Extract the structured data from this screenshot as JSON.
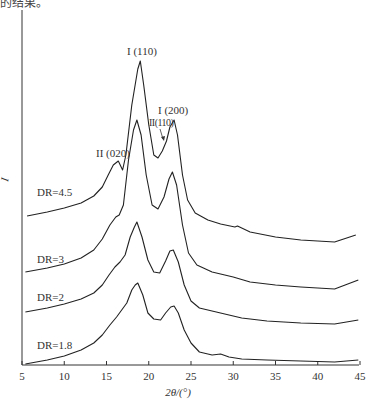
{
  "header": {
    "cut_text": "的结果。"
  },
  "chart_data": {
    "type": "line",
    "title": "",
    "xlabel": "2θ/(°)",
    "ylabel": "I",
    "xlim": [
      5,
      45
    ],
    "xticks": [
      5,
      10,
      15,
      20,
      25,
      30,
      35,
      40,
      45
    ],
    "grid": false,
    "legend": "inline labels",
    "peak_annotations": [
      {
        "text": "I (110)",
        "x": 19.0
      },
      {
        "text": "I (200)",
        "x": 23.0
      },
      {
        "text": "II(110)",
        "x": 21.8
      },
      {
        "text": "II (020)",
        "x": 16.4
      }
    ],
    "series": [
      {
        "name": "DR=4.5",
        "offset_px": 0,
        "points": [
          [
            5.6,
            149
          ],
          [
            8,
            153
          ],
          [
            10,
            157
          ],
          [
            12,
            162
          ],
          [
            13.5,
            169
          ],
          [
            14.5,
            178
          ],
          [
            15.2,
            190
          ],
          [
            15.8,
            200
          ],
          [
            16.4,
            204
          ],
          [
            16.9,
            195
          ],
          [
            17.3,
            210
          ],
          [
            18,
            260
          ],
          [
            18.7,
            296
          ],
          [
            19.0,
            304
          ],
          [
            19.4,
            280
          ],
          [
            20,
            240
          ],
          [
            20.6,
            210
          ],
          [
            21.1,
            207
          ],
          [
            21.6,
            214
          ],
          [
            22.1,
            224
          ],
          [
            22.5,
            238
          ],
          [
            23.0,
            245
          ],
          [
            23.4,
            230
          ],
          [
            24,
            190
          ],
          [
            24.6,
            165
          ],
          [
            25.5,
            152
          ],
          [
            27,
            145
          ],
          [
            28.5,
            141
          ],
          [
            30.2,
            138
          ],
          [
            30.5,
            139
          ],
          [
            32,
            133
          ],
          [
            35,
            128
          ],
          [
            38,
            125
          ],
          [
            42,
            123
          ],
          [
            44.5,
            130
          ]
        ]
      },
      {
        "name": "DR=3",
        "points": [
          [
            5.4,
            93
          ],
          [
            8,
            97
          ],
          [
            10,
            101
          ],
          [
            12,
            107
          ],
          [
            13.5,
            115
          ],
          [
            14.5,
            126
          ],
          [
            15.4,
            140
          ],
          [
            16.1,
            148
          ],
          [
            16.5,
            150
          ],
          [
            17,
            160
          ],
          [
            17.6,
            205
          ],
          [
            18.2,
            235
          ],
          [
            18.6,
            245
          ],
          [
            19.1,
            230
          ],
          [
            19.7,
            190
          ],
          [
            20.4,
            160
          ],
          [
            21.1,
            156
          ],
          [
            21.8,
            168
          ],
          [
            22.4,
            186
          ],
          [
            22.8,
            193
          ],
          [
            23.3,
            180
          ],
          [
            24,
            140
          ],
          [
            24.7,
            112
          ],
          [
            25.7,
            100
          ],
          [
            27.5,
            93
          ],
          [
            29,
            90
          ],
          [
            30,
            88
          ],
          [
            32,
            83
          ],
          [
            35,
            80
          ],
          [
            38,
            78
          ],
          [
            42,
            76
          ],
          [
            44.8,
            85
          ]
        ]
      },
      {
        "name": "DR=2",
        "points": [
          [
            5.4,
            53
          ],
          [
            8,
            57
          ],
          [
            10,
            61
          ],
          [
            12,
            66
          ],
          [
            13.5,
            72
          ],
          [
            14.5,
            80
          ],
          [
            15.3,
            90
          ],
          [
            16,
            98
          ],
          [
            16.6,
            103
          ],
          [
            17.2,
            110
          ],
          [
            17.8,
            128
          ],
          [
            18.3,
            138
          ],
          [
            18.6,
            143
          ],
          [
            19.2,
            128
          ],
          [
            19.9,
            105
          ],
          [
            20.6,
            93
          ],
          [
            21.3,
            92
          ],
          [
            22,
            104
          ],
          [
            22.5,
            114
          ],
          [
            22.9,
            115
          ],
          [
            23.5,
            103
          ],
          [
            24.2,
            80
          ],
          [
            25,
            64
          ],
          [
            26,
            57
          ],
          [
            28,
            53
          ],
          [
            29.5,
            50
          ],
          [
            31,
            47
          ],
          [
            34,
            44
          ],
          [
            38,
            42
          ],
          [
            42,
            41
          ],
          [
            44.8,
            45
          ]
        ]
      },
      {
        "name": "DR=1.8",
        "points": [
          [
            5.4,
            1
          ],
          [
            8,
            5
          ],
          [
            10,
            9
          ],
          [
            12,
            15
          ],
          [
            13.5,
            22
          ],
          [
            14.5,
            30
          ],
          [
            15.4,
            40
          ],
          [
            16.2,
            48
          ],
          [
            16.8,
            55
          ],
          [
            17.4,
            62
          ],
          [
            18,
            75
          ],
          [
            18.4,
            80
          ],
          [
            18.7,
            82
          ],
          [
            19.3,
            70
          ],
          [
            19.9,
            52
          ],
          [
            20.6,
            46
          ],
          [
            21.4,
            45
          ],
          [
            22,
            52
          ],
          [
            22.6,
            58
          ],
          [
            23,
            59
          ],
          [
            23.5,
            52
          ],
          [
            24.2,
            35
          ],
          [
            25,
            22
          ],
          [
            26,
            13
          ],
          [
            27.5,
            10
          ],
          [
            28.5,
            11
          ],
          [
            29.5,
            8
          ],
          [
            31,
            6
          ],
          [
            34,
            5
          ],
          [
            38,
            4
          ],
          [
            42,
            3
          ],
          [
            44.8,
            5
          ]
        ]
      }
    ],
    "series_labels": [
      "DR=4.5",
      "DR=3",
      "DR=2",
      "DR=1.8"
    ]
  }
}
